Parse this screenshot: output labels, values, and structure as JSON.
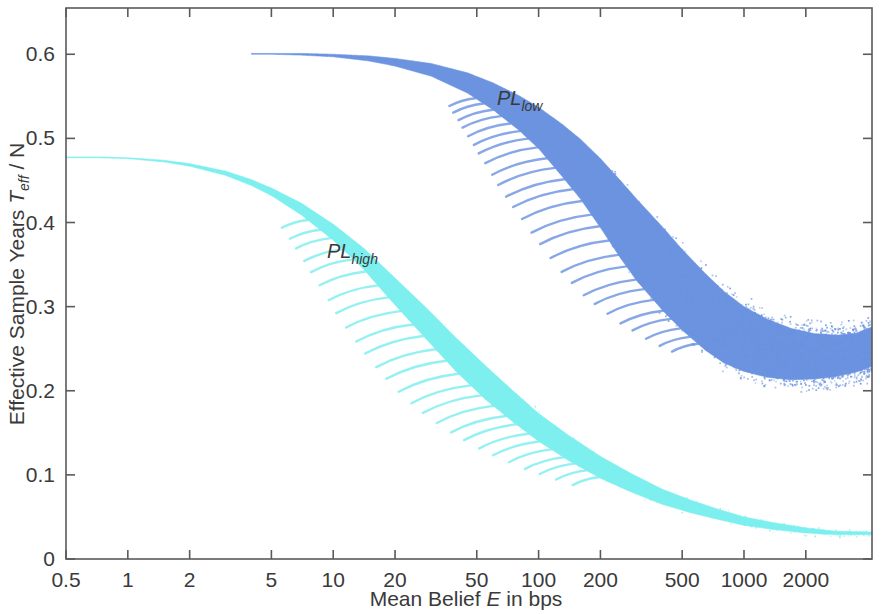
{
  "chart_data": {
    "type": "area",
    "title": "",
    "xlabel": "Mean Belief E in bps",
    "xlabel_parts": {
      "pre": "Mean Belief ",
      "italic": "E",
      "post": " in bps"
    },
    "ylabel": "Effective Sample Years T_eff / N",
    "ylabel_parts": {
      "pre": "Effective Sample Years ",
      "italic": "T",
      "sub": "eff",
      "post": " / N"
    },
    "xscale": "log",
    "yscale": "linear",
    "xlim": [
      0.5,
      4200
    ],
    "ylim": [
      0,
      0.655
    ],
    "grid": false,
    "legend": "inline-annotations",
    "xticks": [
      0.5,
      1,
      2,
      5,
      10,
      20,
      50,
      100,
      200,
      500,
      1000,
      2000
    ],
    "xtick_labels": [
      "0.5",
      "1",
      "2",
      "5",
      "10",
      "20",
      "50",
      "100",
      "200",
      "500",
      "1000",
      "2000"
    ],
    "yticks": [
      0,
      0.1,
      0.2,
      0.3,
      0.4,
      0.5,
      0.6
    ],
    "ytick_labels": [
      "0",
      "0.1",
      "0.2",
      "0.3",
      "0.4",
      "0.5",
      "0.6"
    ],
    "series": [
      {
        "name": "PL_low",
        "label_pre": "PL",
        "label_sub": "low",
        "color": "#6B93E0",
        "x": [
          4.0,
          5,
          7,
          10,
          15,
          20,
          30,
          45,
          60,
          80,
          100,
          130,
          160,
          200,
          250,
          300,
          400,
          500,
          650,
          800,
          1000,
          1300,
          1700,
          2200,
          2800,
          3500,
          4200
        ],
        "upper": [
          0.601,
          0.601,
          0.601,
          0.6,
          0.598,
          0.595,
          0.589,
          0.578,
          0.566,
          0.551,
          0.537,
          0.517,
          0.499,
          0.476,
          0.45,
          0.428,
          0.395,
          0.368,
          0.339,
          0.318,
          0.3,
          0.285,
          0.274,
          0.268,
          0.266,
          0.268,
          0.276
        ],
        "lower": [
          0.6,
          0.6,
          0.599,
          0.597,
          0.592,
          0.586,
          0.574,
          0.554,
          0.534,
          0.51,
          0.488,
          0.455,
          0.428,
          0.394,
          0.358,
          0.331,
          0.296,
          0.272,
          0.248,
          0.233,
          0.223,
          0.216,
          0.213,
          0.214,
          0.217,
          0.222,
          0.229
        ],
        "annotation_x": 70,
        "annotation_y": 0.525
      },
      {
        "name": "PL_high",
        "label_pre": "PL",
        "label_sub": "high",
        "color": "#7DEFEF",
        "x": [
          0.5,
          0.7,
          1,
          1.5,
          2,
          3,
          4,
          5,
          7,
          10,
          14,
          20,
          28,
          40,
          55,
          75,
          100,
          140,
          200,
          280,
          400,
          550,
          750,
          1000,
          1400,
          2000,
          2800,
          4200
        ],
        "upper": [
          0.478,
          0.478,
          0.477,
          0.474,
          0.47,
          0.461,
          0.451,
          0.441,
          0.423,
          0.398,
          0.37,
          0.334,
          0.3,
          0.262,
          0.23,
          0.2,
          0.173,
          0.147,
          0.122,
          0.102,
          0.083,
          0.07,
          0.059,
          0.05,
          0.043,
          0.037,
          0.033,
          0.032
        ],
        "lower": [
          0.477,
          0.477,
          0.476,
          0.472,
          0.467,
          0.456,
          0.444,
          0.432,
          0.409,
          0.379,
          0.345,
          0.302,
          0.263,
          0.222,
          0.19,
          0.163,
          0.14,
          0.117,
          0.096,
          0.08,
          0.065,
          0.055,
          0.047,
          0.04,
          0.035,
          0.031,
          0.029,
          0.029
        ]
      }
    ]
  }
}
